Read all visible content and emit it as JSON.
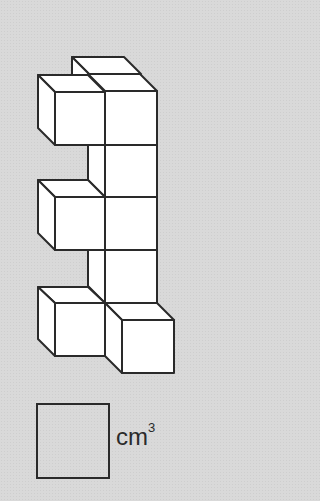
{
  "figure": {
    "cube_count": 10,
    "stroke_color": "#2a2a2a",
    "face_color": "#ffffff",
    "background_color": "#d9d9d9"
  },
  "answer": {
    "value": "",
    "unit_base": "cm",
    "unit_exponent": "3"
  }
}
